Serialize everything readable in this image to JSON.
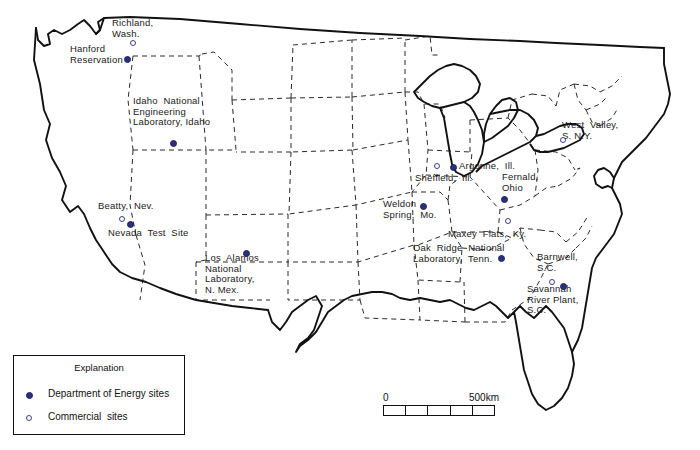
{
  "map": {
    "title": "United States nuclear waste sites map",
    "region": "Conterminous United States",
    "outline_color": "#111111",
    "state_border_style": "dashed",
    "marker_colors": {
      "doe": "#2b2f7a",
      "commercial": "#3a3f86"
    },
    "sites": [
      {
        "name": "richland-wash",
        "label": "Richland,\nWash.",
        "type": "commercial",
        "x": 112,
        "y": 18,
        "mx": 130,
        "my": 40
      },
      {
        "name": "hanford-reservation",
        "label": "Hanford\nReservation",
        "type": "doe",
        "x": 70,
        "y": 44,
        "mx": 124,
        "my": 56
      },
      {
        "name": "idaho-national-lab",
        "label": "Idaho  National\nEngineering\nLaboratory, Idaho",
        "type": "doe",
        "x": 133,
        "y": 96,
        "mx": 170,
        "my": 140
      },
      {
        "name": "beatty-nev",
        "label": "Beatty,  Nev.",
        "type": "commercial",
        "x": 98,
        "y": 201,
        "mx": 119,
        "my": 216
      },
      {
        "name": "nevada-test-site",
        "label": "Nevada  Test  Site",
        "type": "doe",
        "x": 108,
        "y": 228,
        "mx": 127,
        "my": 221
      },
      {
        "name": "los-alamos-national-lab",
        "label": "Los  Alamos\nNational\nLaboratory,\nN. Mex.",
        "type": "doe",
        "x": 205,
        "y": 253,
        "mx": 243,
        "my": 250
      },
      {
        "name": "sheffield-ill",
        "label": "Sheffield,  Ill.",
        "type": "commercial",
        "x": 415,
        "y": 173,
        "mx": 434,
        "my": 163
      },
      {
        "name": "argonne-ill",
        "label": "Argonne,  Ill.",
        "type": "doe",
        "x": 459,
        "y": 161,
        "mx": 450,
        "my": 164
      },
      {
        "name": "fernald-ohio",
        "label": "Fernald,\nOhio",
        "type": "doe",
        "x": 502,
        "y": 172,
        "mx": 501,
        "my": 196
      },
      {
        "name": "weldon-spring-mo",
        "label": "Weldon\nSpring,  Mo.",
        "type": "doe",
        "x": 383,
        "y": 199,
        "mx": 420,
        "my": 203
      },
      {
        "name": "maxey-flats-ky",
        "label": "Maxey  Flats,  Ky.",
        "type": "commercial",
        "x": 448,
        "y": 229,
        "mx": 505,
        "my": 218
      },
      {
        "name": "oak-ridge-national-lab",
        "label": "Oak  Ridge  National\nLaboratory,  Tenn.",
        "type": "doe",
        "x": 413,
        "y": 243,
        "mx": 498,
        "my": 255
      },
      {
        "name": "barnwell-sc",
        "label": "Barnwell,\nS.C.",
        "type": "commercial",
        "x": 537,
        "y": 252,
        "mx": 549,
        "my": 279
      },
      {
        "name": "savannah-river-plant",
        "label": "Savannah\nRiver Plant,\nS.C.",
        "type": "doe",
        "x": 527,
        "y": 284,
        "mx": 560,
        "my": 283
      },
      {
        "name": "west-valley-ny",
        "label": "West  Valley,\nS. N.Y.",
        "type": "commercial",
        "x": 562,
        "y": 120,
        "mx": 560,
        "my": 137
      }
    ]
  },
  "legend": {
    "title": "Explanation",
    "items": [
      {
        "name": "doe-sites",
        "label": "Department of Energy sites",
        "marker": "filled-dot"
      },
      {
        "name": "commercial-sites",
        "label": "Commercial  sites",
        "marker": "open-circle"
      }
    ]
  },
  "scale": {
    "min_label": "0",
    "max_label": "500km",
    "segments": 5
  }
}
